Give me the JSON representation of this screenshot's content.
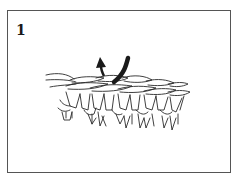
{
  "figure": {
    "step_label": "1",
    "colors": {
      "frame": "#555555",
      "line": "#2a2a2a",
      "arrow": "#1a1a1a",
      "background": "#ffffff"
    },
    "icons": [
      "arrow-up-icon",
      "hook-icon"
    ]
  }
}
